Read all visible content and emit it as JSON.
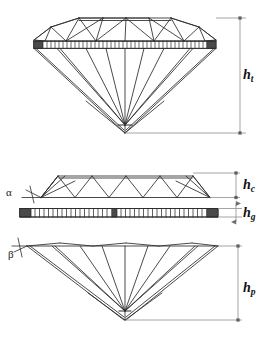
{
  "figure": {
    "background_color": "#ffffff",
    "line_color": "#2b2b2b",
    "dimension_line_color": "#8c8c8c",
    "girdle_fill_color": "#4a4a4a"
  },
  "views": {
    "full_stone": {
      "name": "Complete brilliant cut profile",
      "has_table_facet": true,
      "has_culet_point": true
    },
    "crown": {
      "name": "Crown section detail"
    },
    "girdle": {
      "name": "Girdle band detail",
      "segment_count": 46
    },
    "pavilion": {
      "name": "Pavilion section detail"
    }
  },
  "dimensions": [
    {
      "id": "ht",
      "symbol": "h",
      "subscript": "t",
      "meaning": "total height",
      "view": "full_stone",
      "arrow_style": "plain"
    },
    {
      "id": "hc",
      "symbol": "h",
      "subscript": "c",
      "meaning": "crown height",
      "view": "crown",
      "arrow_style": "plain"
    },
    {
      "id": "hg",
      "symbol": "h",
      "subscript": "g",
      "meaning": "girdle height",
      "view": "girdle",
      "arrow_style": "double-arrow"
    },
    {
      "id": "hp",
      "symbol": "h",
      "subscript": "p",
      "meaning": "pavilion height",
      "view": "pavilion",
      "arrow_style": "plain"
    }
  ],
  "angles": [
    {
      "id": "alpha",
      "glyph": "α",
      "meaning": "crown angle",
      "view": "crown"
    },
    {
      "id": "beta",
      "glyph": "β",
      "meaning": "pavilion angle",
      "view": "pavilion"
    }
  ]
}
